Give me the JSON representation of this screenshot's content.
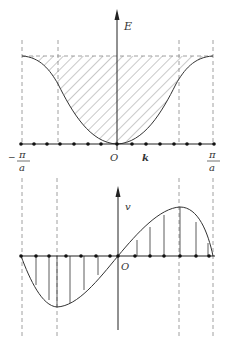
{
  "diagram": {
    "top_panel": {
      "y_axis_label": "E",
      "x_axis_label": "k",
      "origin_label": "O",
      "left_tick": {
        "sign": "−",
        "num": "π",
        "den": "a"
      },
      "right_tick": {
        "num": "π",
        "den": "a"
      },
      "curve": "E(k) band: cosine-like well, minimum at k=0, rising to top at ±π/a",
      "hatched_region": "area between curve and top dashed line",
      "k_points": 15
    },
    "bottom_panel": {
      "y_axis_label": "v",
      "origin_label": "O",
      "curve": "v(k) velocity: sine-like, negative min near −π/(2a), positive max near +π/(2a), zero at 0 and ±π/a",
      "k_points": 13
    },
    "colors": {
      "line": "#333333",
      "dashed": "#777777",
      "hatch": "#777777"
    }
  }
}
